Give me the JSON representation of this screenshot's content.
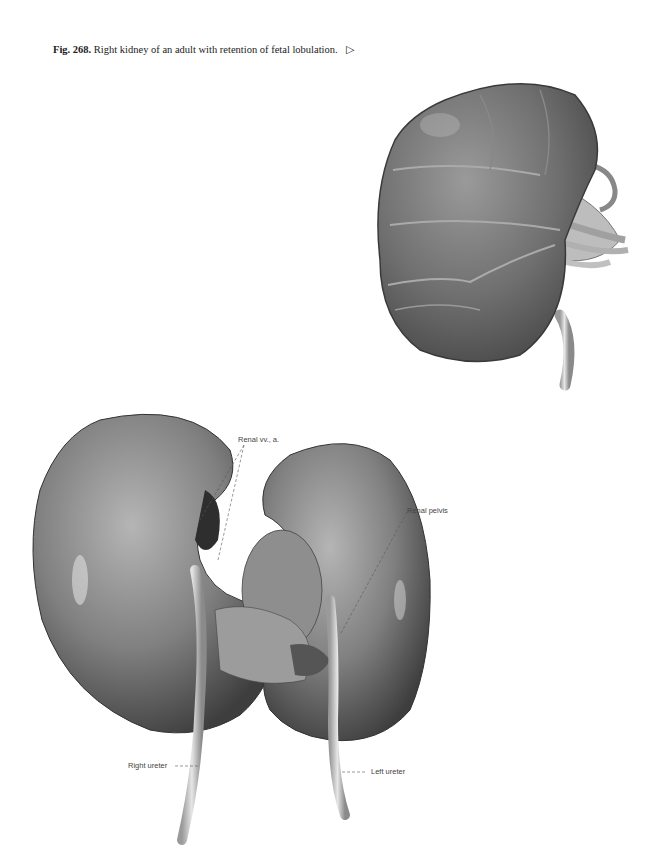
{
  "caption": {
    "fig_number": "Fig. 268.",
    "text": "Right kidney of an adult with retention of fetal lobulation.",
    "arrow_glyph": "▷"
  },
  "figures": {
    "top": {
      "description": "Lobulated right kidney illustration"
    },
    "bottom": {
      "description": "Horseshoe / fused kidneys specimen",
      "labels": {
        "renal_vessels": "Renal vv., a.",
        "renal_pelvis": "Renal pelvis",
        "right_ureter": "Right ureter",
        "left_ureter": "Left ureter"
      }
    }
  }
}
